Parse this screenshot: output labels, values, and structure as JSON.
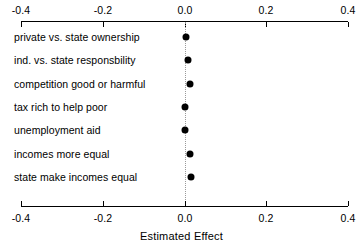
{
  "chart_data": {
    "type": "scatter",
    "title": "",
    "subtitle": "",
    "xlabel": "Estimated Effect",
    "ylabel": "",
    "xlim": [
      -0.4,
      0.4
    ],
    "xticks": [
      "-0.4",
      "-0.2",
      "0.0",
      "0.2",
      "0.4"
    ],
    "xtick_values": [
      -0.4,
      -0.2,
      0.0,
      0.2,
      0.4
    ],
    "grid": false,
    "legend": "none",
    "reference_line": 0.0,
    "axes": [
      "top",
      "bottom"
    ],
    "categories": [
      "private vs. state ownership",
      "ind. vs. state responsbility",
      "competition good or harmful",
      "tax rich to help poor",
      "unemployment aid",
      "incomes more equal",
      "state make incomes equal"
    ],
    "values": [
      0.004,
      0.008,
      0.014,
      0.001,
      0.0,
      0.013,
      0.016
    ],
    "series": [
      {
        "name": "Estimated Effect",
        "values": [
          0.004,
          0.008,
          0.014,
          0.001,
          0.0,
          0.013,
          0.016
        ],
        "ci_low": [
          -0.002,
          0.002,
          0.008,
          -0.004,
          -0.005,
          0.007,
          0.009
        ],
        "ci_high": [
          0.01,
          0.014,
          0.02,
          0.006,
          0.005,
          0.019,
          0.023
        ],
        "marker": "filled-circle",
        "color": "#000000"
      }
    ]
  },
  "axis": {
    "title": "Estimated Effect",
    "tick_labels": [
      "-0.4",
      "-0.2",
      "0.0",
      "0.2",
      "0.4"
    ]
  },
  "colors": {
    "point": "#000000",
    "axis": "#000000",
    "reference_line": "#9a9a9a",
    "background": "#ffffff"
  }
}
